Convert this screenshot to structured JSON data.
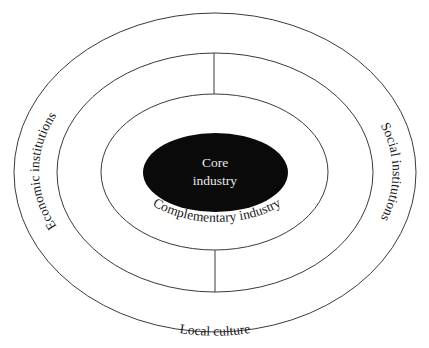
{
  "diagram": {
    "type": "concentric-ellipses",
    "rings": [
      {
        "id": "local-culture",
        "label": "Local culture"
      },
      {
        "id": "institutions",
        "left_label": "Economic institutions",
        "right_label": "Social institutions"
      },
      {
        "id": "complementary",
        "label": "Complementary industry"
      },
      {
        "id": "core",
        "label_line1": "Core",
        "label_line2": "industry"
      }
    ],
    "colors": {
      "stroke": "#3a3a3a",
      "core_fill": "#0a0a0a",
      "core_text": "#e8e8e8",
      "text": "#1a1a1a",
      "background": "#ffffff"
    }
  }
}
